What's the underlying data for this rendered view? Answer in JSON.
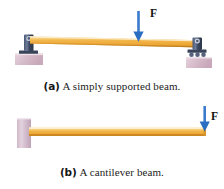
{
  "figure": {
    "background_color": "#ffffff",
    "panels": [
      {
        "id": "panel-a",
        "tag": "(a)",
        "caption": "A simply supported beam.",
        "beam": {
          "name": "simply supported beam",
          "color_top": "#f6dca2",
          "color_body": "#efa93a",
          "color_bottom": "#c9821f"
        },
        "load": {
          "label": "F",
          "direction": "down",
          "color": "#2f6fc4"
        },
        "supports": [
          {
            "type": "pin",
            "position": "left",
            "bracket_color": "#3e4a63",
            "base_color": "#d6bcc8"
          },
          {
            "type": "roller",
            "position": "right",
            "bracket_color": "#3e4a63",
            "base_color": "#d6bcc8"
          }
        ]
      },
      {
        "id": "panel-b",
        "tag": "(b)",
        "caption": "A cantilever beam.",
        "beam": {
          "name": "cantilever beam",
          "color_top": "#f6dca2",
          "color_body": "#efa93a",
          "color_bottom": "#c9821f"
        },
        "load": {
          "label": "F",
          "direction": "down",
          "color": "#2f6fc4"
        },
        "supports": [
          {
            "type": "fixed-wall",
            "position": "left",
            "base_color": "#d9c2d2"
          }
        ]
      }
    ]
  }
}
